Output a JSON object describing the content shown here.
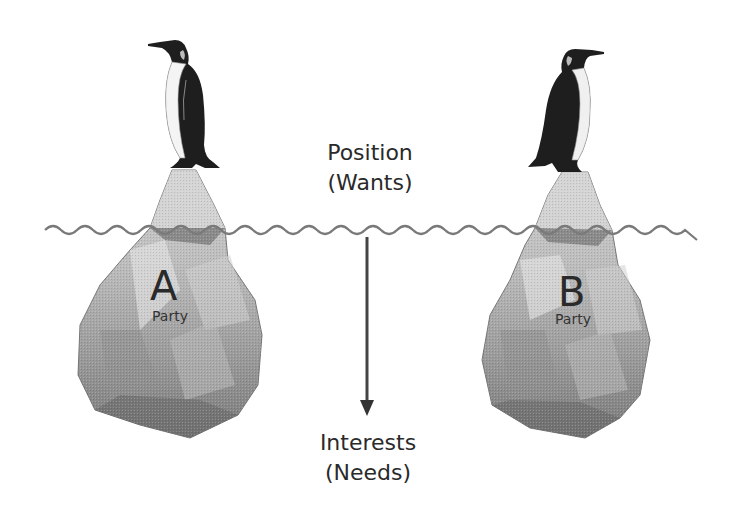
{
  "diagram": {
    "type": "iceberg-model",
    "top_label": {
      "line1": "Position",
      "line2": "(Wants)"
    },
    "bottom_label": {
      "line1": "Interests",
      "line2": "(Needs)"
    },
    "parties": [
      {
        "letter": "A",
        "caption": "Party",
        "icon": "penguin-icon"
      },
      {
        "letter": "B",
        "caption": "Party",
        "icon": "penguin-icon"
      }
    ],
    "waterline": {
      "icon": "wave-line",
      "color": "#777777"
    },
    "arrow": {
      "direction": "down",
      "color": "#444444"
    },
    "colors": {
      "iceberg_light": "#d4d4d4",
      "iceberg_mid": "#a8a8a8",
      "iceberg_dark": "#6e6e6e",
      "penguin_black": "#1e1e1e",
      "penguin_white": "#f4f4f4",
      "text": "#2a2a2a"
    }
  }
}
